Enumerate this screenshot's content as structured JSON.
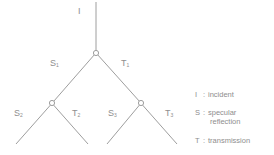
{
  "diagram": {
    "title": "",
    "root_label": "I",
    "branch_labels": {
      "s1": {
        "letter": "S",
        "sub": "1"
      },
      "t1": {
        "letter": "T",
        "sub": "1"
      },
      "s2": {
        "letter": "S",
        "sub": "2"
      },
      "t2": {
        "letter": "T",
        "sub": "2"
      },
      "s3": {
        "letter": "S",
        "sub": "3"
      },
      "t3": {
        "letter": "T",
        "sub": "3"
      }
    },
    "nodes": [
      {
        "id": "root",
        "x": 96,
        "y": 53
      },
      {
        "id": "left",
        "x": 52,
        "y": 103
      },
      {
        "id": "right",
        "x": 141,
        "y": 103
      }
    ],
    "line_color": "#9a9a9a"
  },
  "legend": {
    "items": [
      {
        "key": "I",
        "sep": ":",
        "text": "incident"
      },
      {
        "key": "S",
        "sep": ":",
        "text": "specular",
        "text2": "reflection"
      },
      {
        "key": "T",
        "sep": ":",
        "text": "transmission"
      }
    ]
  }
}
